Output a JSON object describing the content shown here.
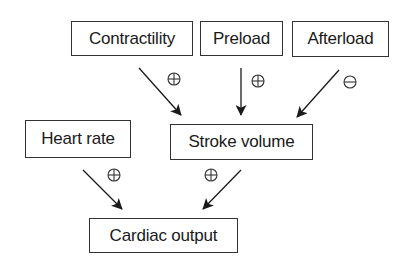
{
  "diagram": {
    "nodes": {
      "contractility": {
        "label": "Contractility",
        "x": 71,
        "y": 21,
        "w": 122,
        "h": 35
      },
      "preload": {
        "label": "Preload",
        "x": 200,
        "y": 21,
        "w": 83,
        "h": 35
      },
      "afterload": {
        "label": "Afterload",
        "x": 292,
        "y": 21,
        "w": 97,
        "h": 36
      },
      "heart_rate": {
        "label": "Heart rate",
        "x": 25,
        "y": 120,
        "w": 106,
        "h": 38
      },
      "stroke_volume": {
        "label": "Stroke volume",
        "x": 170,
        "y": 124,
        "w": 143,
        "h": 36
      },
      "cardiac_output": {
        "label": "Cardiac output",
        "x": 89,
        "y": 218,
        "w": 149,
        "h": 35
      }
    },
    "edges": [
      {
        "from": "Contractility",
        "to": "Stroke volume",
        "effect": "positive",
        "symbol": "⊕"
      },
      {
        "from": "Preload",
        "to": "Stroke volume",
        "effect": "positive",
        "symbol": "⊕"
      },
      {
        "from": "Afterload",
        "to": "Stroke volume",
        "effect": "negative",
        "symbol": "⊖"
      },
      {
        "from": "Heart rate",
        "to": "Cardiac output",
        "effect": "positive",
        "symbol": "⊕"
      },
      {
        "from": "Stroke volume",
        "to": "Cardiac output",
        "effect": "positive",
        "symbol": "⊕"
      }
    ],
    "colors": {
      "line": "#1a1a1a",
      "border": "#333333",
      "background": "#ffffff"
    }
  }
}
